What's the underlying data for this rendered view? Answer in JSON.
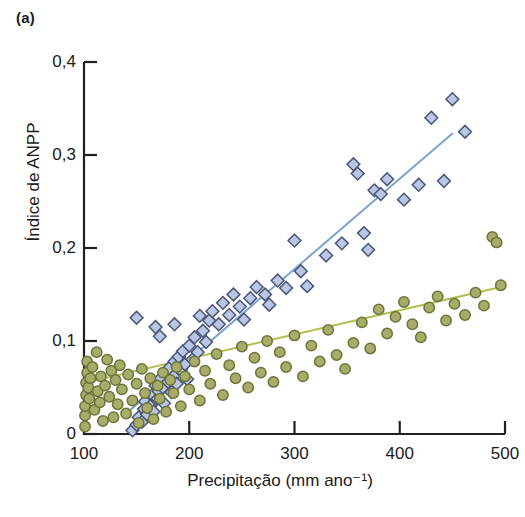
{
  "figure": {
    "panel_label": "(a)",
    "background_color": "#ffffff",
    "axis_color": "#231f20"
  },
  "chart_data": {
    "type": "scatter",
    "title": "",
    "panel": "(a)",
    "xlabel": "Precipitação (mm ano⁻¹)",
    "ylabel": "Índice de ANPP",
    "xlim": [
      100,
      500
    ],
    "ylim": [
      0,
      0.4
    ],
    "xticks": [
      100,
      200,
      300,
      400,
      500
    ],
    "xtick_labels": [
      "100",
      "200",
      "300",
      "400",
      "500"
    ],
    "yticks": [
      0,
      0.1,
      0.2,
      0.3,
      0.4
    ],
    "ytick_labels": [
      "0",
      "0,1",
      "0,2",
      "0,3",
      "0,4"
    ],
    "grid": false,
    "legend_position": "none",
    "decimal_separator": ",",
    "series": [
      {
        "name": "serie-diamantes-azuis",
        "marker": "diamond",
        "color": "#b9c7e4",
        "edge_color": "#4a5578",
        "trendline": {
          "color": "#7ba3d0",
          "x": [
            140,
            450
          ],
          "y": [
            0.022,
            0.323
          ]
        },
        "points": [
          [
            146,
            0.004
          ],
          [
            150,
            0.01
          ],
          [
            152,
            0.018
          ],
          [
            155,
            0.013
          ],
          [
            157,
            0.027
          ],
          [
            160,
            0.021
          ],
          [
            158,
            0.035
          ],
          [
            163,
            0.03
          ],
          [
            165,
            0.042
          ],
          [
            166,
            0.024
          ],
          [
            168,
            0.052
          ],
          [
            170,
            0.038
          ],
          [
            171,
            0.046
          ],
          [
            173,
            0.06
          ],
          [
            175,
            0.05
          ],
          [
            176,
            0.033
          ],
          [
            178,
            0.066
          ],
          [
            180,
            0.056
          ],
          [
            181,
            0.071
          ],
          [
            183,
            0.045
          ],
          [
            185,
            0.062
          ],
          [
            186,
            0.078
          ],
          [
            188,
            0.054
          ],
          [
            190,
            0.083
          ],
          [
            192,
            0.069
          ],
          [
            194,
            0.089
          ],
          [
            196,
            0.075
          ],
          [
            198,
            0.059
          ],
          [
            200,
            0.095
          ],
          [
            203,
            0.08
          ],
          [
            205,
            0.104
          ],
          [
            208,
            0.088
          ],
          [
            210,
            0.127
          ],
          [
            213,
            0.111
          ],
          [
            216,
            0.099
          ],
          [
            219,
            0.122
          ],
          [
            150,
            0.125
          ],
          [
            168,
            0.115
          ],
          [
            172,
            0.105
          ],
          [
            186,
            0.118
          ],
          [
            222,
            0.132
          ],
          [
            228,
            0.118
          ],
          [
            232,
            0.141
          ],
          [
            238,
            0.128
          ],
          [
            242,
            0.15
          ],
          [
            248,
            0.137
          ],
          [
            252,
            0.123
          ],
          [
            258,
            0.146
          ],
          [
            264,
            0.158
          ],
          [
            272,
            0.15
          ],
          [
            276,
            0.139
          ],
          [
            284,
            0.165
          ],
          [
            292,
            0.157
          ],
          [
            300,
            0.208
          ],
          [
            306,
            0.175
          ],
          [
            312,
            0.159
          ],
          [
            330,
            0.192
          ],
          [
            345,
            0.205
          ],
          [
            356,
            0.29
          ],
          [
            360,
            0.28
          ],
          [
            366,
            0.216
          ],
          [
            370,
            0.198
          ],
          [
            376,
            0.262
          ],
          [
            382,
            0.258
          ],
          [
            388,
            0.274
          ],
          [
            404,
            0.252
          ],
          [
            418,
            0.268
          ],
          [
            430,
            0.34
          ],
          [
            442,
            0.272
          ],
          [
            450,
            0.36
          ],
          [
            462,
            0.325
          ]
        ]
      },
      {
        "name": "serie-circulos-verdes",
        "marker": "circle",
        "color": "#a8ac6a",
        "edge_color": "#6e7438",
        "trendline": {
          "color": "#b3bd4e",
          "x": [
            100,
            492
          ],
          "y": [
            0.055,
            0.157
          ]
        },
        "points": [
          [
            101,
            0.008
          ],
          [
            101,
            0.02
          ],
          [
            101,
            0.03
          ],
          [
            102,
            0.042
          ],
          [
            102,
            0.055
          ],
          [
            103,
            0.066
          ],
          [
            103,
            0.078
          ],
          [
            104,
            0.05
          ],
          [
            105,
            0.038
          ],
          [
            106,
            0.06
          ],
          [
            108,
            0.072
          ],
          [
            110,
            0.026
          ],
          [
            112,
            0.088
          ],
          [
            113,
            0.046
          ],
          [
            115,
            0.034
          ],
          [
            116,
            0.062
          ],
          [
            118,
            0.014
          ],
          [
            120,
            0.052
          ],
          [
            122,
            0.08
          ],
          [
            124,
            0.04
          ],
          [
            126,
            0.068
          ],
          [
            128,
            0.018
          ],
          [
            130,
            0.058
          ],
          [
            132,
            0.032
          ],
          [
            134,
            0.074
          ],
          [
            136,
            0.048
          ],
          [
            140,
            0.022
          ],
          [
            142,
            0.064
          ],
          [
            146,
            0.036
          ],
          [
            150,
            0.054
          ],
          [
            152,
            0.012
          ],
          [
            155,
            0.07
          ],
          [
            158,
            0.044
          ],
          [
            160,
            0.028
          ],
          [
            163,
            0.06
          ],
          [
            166,
            0.016
          ],
          [
            170,
            0.052
          ],
          [
            172,
            0.038
          ],
          [
            175,
            0.066
          ],
          [
            178,
            0.024
          ],
          [
            182,
            0.058
          ],
          [
            185,
            0.044
          ],
          [
            188,
            0.072
          ],
          [
            192,
            0.03
          ],
          [
            196,
            0.062
          ],
          [
            200,
            0.048
          ],
          [
            205,
            0.078
          ],
          [
            210,
            0.036
          ],
          [
            215,
            0.068
          ],
          [
            220,
            0.054
          ],
          [
            226,
            0.086
          ],
          [
            232,
            0.042
          ],
          [
            238,
            0.074
          ],
          [
            244,
            0.06
          ],
          [
            250,
            0.094
          ],
          [
            256,
            0.05
          ],
          [
            262,
            0.082
          ],
          [
            268,
            0.066
          ],
          [
            274,
            0.1
          ],
          [
            280,
            0.056
          ],
          [
            286,
            0.088
          ],
          [
            292,
            0.072
          ],
          [
            300,
            0.106
          ],
          [
            308,
            0.062
          ],
          [
            316,
            0.095
          ],
          [
            324,
            0.078
          ],
          [
            332,
            0.112
          ],
          [
            340,
            0.085
          ],
          [
            348,
            0.07
          ],
          [
            356,
            0.098
          ],
          [
            364,
            0.12
          ],
          [
            372,
            0.092
          ],
          [
            380,
            0.134
          ],
          [
            388,
            0.108
          ],
          [
            396,
            0.126
          ],
          [
            404,
            0.142
          ],
          [
            412,
            0.118
          ],
          [
            420,
            0.104
          ],
          [
            428,
            0.136
          ],
          [
            436,
            0.148
          ],
          [
            444,
            0.122
          ],
          [
            452,
            0.14
          ],
          [
            462,
            0.128
          ],
          [
            472,
            0.152
          ],
          [
            480,
            0.138
          ],
          [
            488,
            0.212
          ],
          [
            492,
            0.206
          ],
          [
            496,
            0.16
          ]
        ]
      }
    ]
  }
}
